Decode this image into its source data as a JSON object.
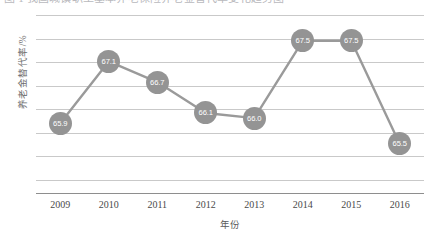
{
  "caption": {
    "text": "图 1  我国城镇职工基本养老保险养老金替代率变化趋势图"
  },
  "chart_data": {
    "type": "line",
    "title": "",
    "subtitle": "",
    "xlabel": "年份",
    "ylabel": "养老金替代率/%",
    "categories": [
      "2009",
      "2010",
      "2011",
      "2012",
      "2013",
      "2014",
      "2015",
      "2016"
    ],
    "values": [
      65.9,
      67.1,
      66.7,
      66.1,
      66.0,
      67.5,
      67.5,
      65.5
    ],
    "point_labels": [
      "65.9",
      "67.1",
      "66.7",
      "66.1",
      "66.0",
      "67.5",
      "67.5",
      "65.5"
    ],
    "series": [
      {
        "name": "养老金替代率",
        "values": [
          65.9,
          67.1,
          66.7,
          66.1,
          66.0,
          67.5,
          67.5,
          65.5
        ]
      }
    ],
    "ylim": [
      64.8,
      68.0
    ],
    "xlim": [
      2009,
      2016
    ],
    "grid": true,
    "gridline_count": 8,
    "legend": "none",
    "marker": "circle",
    "marker_color": "#949494",
    "line_color": "#9a9a9a",
    "label_color": "#ffffff",
    "gridline_color": "#c9c9c9",
    "axis_color": "#8e8e8e",
    "y_tick_labels": []
  }
}
